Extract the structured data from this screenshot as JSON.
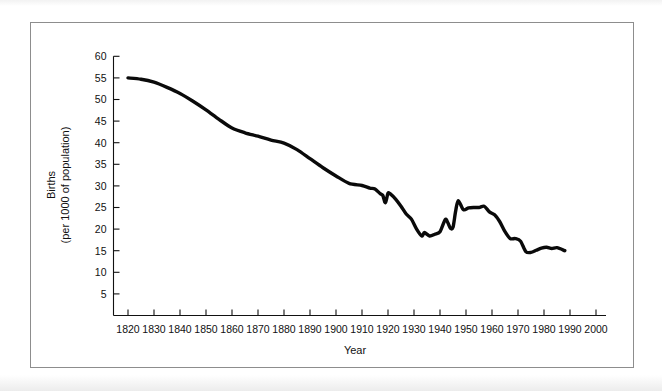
{
  "figure": {
    "background_color": "#ffffff",
    "frame_color": "#8d8d8d",
    "line_color": "#0a0a0a"
  },
  "axis": {
    "x_title": "Year",
    "y_title_line1": "Births",
    "y_title_line2": "(per 1000 of population)"
  },
  "chart_data": {
    "type": "line",
    "title": "",
    "subtitle": "",
    "xlabel": "Year",
    "ylabel": "Births (per 1000 of population)",
    "xlim": [
      1815,
      2000
    ],
    "ylim": [
      0,
      60
    ],
    "grid": false,
    "legend": null,
    "x_ticks": [
      1820,
      1830,
      1840,
      1850,
      1860,
      1870,
      1880,
      1890,
      1900,
      1910,
      1920,
      1930,
      1940,
      1950,
      1960,
      1970,
      1980,
      1990,
      2000
    ],
    "y_ticks": [
      5,
      10,
      15,
      20,
      25,
      30,
      35,
      40,
      45,
      50,
      55,
      60
    ],
    "series": [
      {
        "name": "Birth rate per 1000 of population",
        "x": [
          1820,
          1825,
          1830,
          1835,
          1840,
          1845,
          1850,
          1855,
          1860,
          1865,
          1870,
          1875,
          1880,
          1885,
          1890,
          1895,
          1900,
          1905,
          1910,
          1913,
          1915,
          1917,
          1918,
          1919,
          1920,
          1921,
          1923,
          1925,
          1927,
          1929,
          1931,
          1933,
          1934,
          1936,
          1938,
          1940,
          1942,
          1943,
          1944,
          1945,
          1946,
          1947,
          1949,
          1951,
          1953,
          1955,
          1957,
          1959,
          1961,
          1963,
          1965,
          1967,
          1969,
          1971,
          1973,
          1975,
          1977,
          1979,
          1981,
          1983,
          1985,
          1988
        ],
        "y": [
          55.0,
          54.7,
          54.0,
          52.8,
          51.4,
          49.6,
          47.6,
          45.4,
          43.4,
          42.3,
          41.5,
          40.6,
          39.9,
          38.4,
          36.3,
          34.2,
          32.3,
          30.6,
          30.1,
          29.5,
          29.3,
          28.2,
          27.8,
          26.1,
          28.3,
          28.1,
          26.9,
          25.3,
          23.5,
          22.3,
          20.0,
          18.4,
          19.2,
          18.4,
          18.8,
          19.4,
          22.2,
          21.5,
          20.2,
          20.4,
          24.1,
          26.6,
          24.5,
          24.9,
          25.0,
          25.0,
          25.3,
          24.0,
          23.3,
          21.7,
          19.4,
          17.8,
          17.8,
          17.2,
          14.8,
          14.6,
          15.1,
          15.6,
          15.8,
          15.5,
          15.7,
          15.0
        ]
      }
    ],
    "annotations": []
  }
}
